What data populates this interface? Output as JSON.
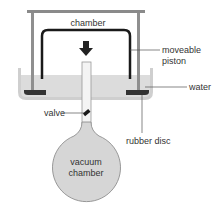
{
  "diagram": {
    "labels": {
      "chamber": "chamber",
      "moveable_piston_line1": "moveable",
      "moveable_piston_line2": "piston",
      "water": "water",
      "valve": "valve",
      "rubber_disc": "rubber disc",
      "vacuum_chamber_line1": "vacuum",
      "vacuum_chamber_line2": "chamber"
    },
    "arrow_direction": "down",
    "colors": {
      "frame": "#8a8a8a",
      "piston": "#1a1a1a",
      "water": "#d9d9d9",
      "trough_edge": "#c8c8c8",
      "rubber_disc": "#333333",
      "flask": "#d6d6d6",
      "flask_outline": "#8f8f8f",
      "text": "#333333"
    }
  }
}
